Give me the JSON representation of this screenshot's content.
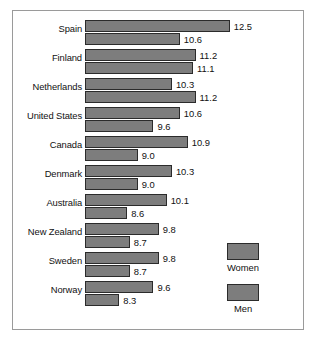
{
  "chart_data": {
    "type": "bar",
    "orientation": "horizontal",
    "title": "",
    "subtitle": "",
    "xlabel": "",
    "ylabel": "",
    "grid": false,
    "legend_position": "bottom-right",
    "bar_baseline_value": 7.0,
    "xlim": [
      7.0,
      13.0
    ],
    "categories": [
      "Spain",
      "Finland",
      "Netherlands",
      "United States",
      "Canada",
      "Denmark",
      "Australia",
      "New Zealand",
      "Sweden",
      "Norway"
    ],
    "series": [
      {
        "name": "Women",
        "color": "#7d7d7d",
        "values": [
          12.5,
          11.2,
          10.3,
          10.6,
          10.9,
          10.3,
          10.1,
          9.8,
          9.8,
          9.6
        ],
        "labels": [
          "12.5",
          "11.2",
          "10.3",
          "10.6",
          "10.9",
          "10.3",
          "10.1",
          "9.8",
          "9.8",
          "9.6"
        ]
      },
      {
        "name": "Men",
        "color": "#7d7d7d",
        "values": [
          10.6,
          11.1,
          11.2,
          9.6,
          9.0,
          9.0,
          8.6,
          8.7,
          8.7,
          8.3
        ],
        "labels": [
          "10.6",
          "11.1",
          "11.2",
          "9.6",
          "9.0",
          "9.0",
          "8.6",
          "8.7",
          "8.7",
          "8.3"
        ]
      }
    ]
  },
  "legend": {
    "items": [
      {
        "label": "Women",
        "color": "#7d7d7d"
      },
      {
        "label": "Men",
        "color": "#7d7d7d"
      }
    ]
  },
  "colors": {
    "bar_fill": "#7d7d7d",
    "bar_stroke": "#2b2b2b",
    "frame_border": "#9a9a9a",
    "text": "#111111",
    "background": "#ffffff"
  }
}
